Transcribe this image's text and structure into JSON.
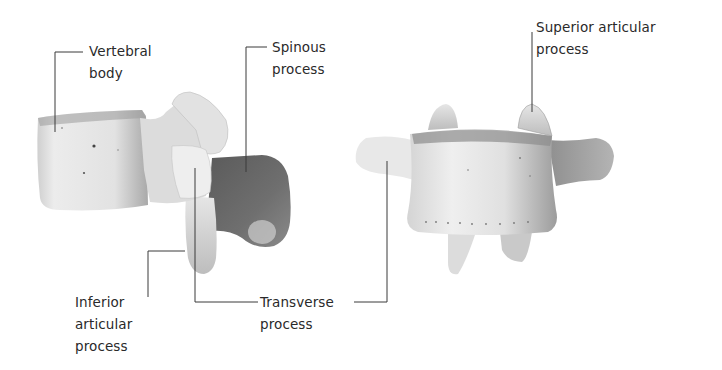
{
  "figure": {
    "views": [
      {
        "id": "lateral-view",
        "description": "Lumbar vertebra, lateral view"
      },
      {
        "id": "anterior-view",
        "description": "Lumbar vertebra, anterior view"
      }
    ],
    "labels": {
      "vertebral_body": "Vertebral\nbody",
      "spinous_process": "Spinous\nprocess",
      "superior_articular_process": "Superior articular\nprocess",
      "inferior_articular_process": "Inferior\narticular\nprocess",
      "transverse_process": "Transverse\nprocess"
    },
    "colors": {
      "text": "#2a2a2a",
      "leader_line": "#3a3a3a",
      "bone_light": "#e6e6e6",
      "bone_mid": "#b5b5b5",
      "bone_dark": "#6e6e6e",
      "background": "#ffffff"
    }
  }
}
